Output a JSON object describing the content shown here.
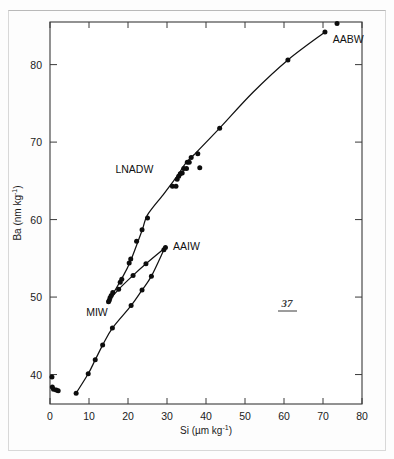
{
  "page": {
    "page_number": "37"
  },
  "chart_data": {
    "type": "scatter",
    "title": "",
    "subtitle": "",
    "xlabel": "Si (µm kg⁻¹)",
    "ylabel": "Ba (nm kg⁻¹)",
    "xlabel_parts": {
      "base": "Si (µm kg",
      "exponent": "-1",
      "tail": ")"
    },
    "ylabel_parts": {
      "base": "Ba (nm kg",
      "exponent": "-1",
      "tail": ")"
    },
    "xlim": [
      0,
      80
    ],
    "ylim": [
      36.2,
      85.5
    ],
    "xticks": [
      0,
      10,
      20,
      30,
      40,
      50,
      60,
      70,
      80
    ],
    "yticks": [
      40,
      50,
      60,
      70,
      80
    ],
    "xtick_labels": [
      "0",
      "10",
      "20",
      "30",
      "40",
      "50",
      "60",
      "70",
      "80"
    ],
    "ytick_labels": [
      "40",
      "50",
      "60",
      "70",
      "80"
    ],
    "grid": false,
    "legend_position": "inline-annotations",
    "marker_color": "#0d0d0d",
    "line_color": "#111111",
    "annotations": [
      {
        "label": "AABW",
        "x": 71.5,
        "y": 84.0,
        "anchor": "start",
        "dx": 4,
        "dy": 9
      },
      {
        "label": "LNADW",
        "x": 27.0,
        "y": 66.4,
        "anchor": "end",
        "dx": -2,
        "dy": 3
      },
      {
        "label": "AAIW",
        "x": 30.8,
        "y": 56.3,
        "anchor": "start",
        "dx": 3,
        "dy": 2
      },
      {
        "label": "MIW",
        "x": 14.3,
        "y": 49.0,
        "anchor": "end",
        "dx": 2,
        "dy": 11
      }
    ],
    "series": [
      {
        "name": "deep-water-main-curve",
        "label": "LNADW-AABW main trend",
        "type": "line",
        "points": [
          {
            "x": 15.3,
            "y": 49.7
          },
          {
            "x": 18.3,
            "y": 52.3
          },
          {
            "x": 20.6,
            "y": 54.6
          },
          {
            "x": 23.6,
            "y": 58.6
          },
          {
            "x": 25.0,
            "y": 60.6
          },
          {
            "x": 29.0,
            "y": 63.2
          },
          {
            "x": 31.7,
            "y": 65.0
          },
          {
            "x": 33.0,
            "y": 65.9
          },
          {
            "x": 34.8,
            "y": 67.3
          },
          {
            "x": 37.0,
            "y": 68.4
          },
          {
            "x": 43.5,
            "y": 71.8
          },
          {
            "x": 52.0,
            "y": 76.4
          },
          {
            "x": 61.0,
            "y": 80.6
          },
          {
            "x": 70.5,
            "y": 84.2
          }
        ]
      },
      {
        "name": "aaiw-branch",
        "label": "AAIW branch",
        "type": "line",
        "points": [
          {
            "x": 15.2,
            "y": 49.6
          },
          {
            "x": 17.6,
            "y": 51.0
          },
          {
            "x": 21.3,
            "y": 52.8
          },
          {
            "x": 24.6,
            "y": 54.3
          },
          {
            "x": 29.6,
            "y": 56.4
          }
        ]
      },
      {
        "name": "miw-branch",
        "label": "MIW branch",
        "type": "line",
        "points": [
          {
            "x": 6.7,
            "y": 37.6
          },
          {
            "x": 9.8,
            "y": 40.1
          },
          {
            "x": 11.6,
            "y": 41.9
          },
          {
            "x": 13.5,
            "y": 43.8
          },
          {
            "x": 16.0,
            "y": 46.0
          },
          {
            "x": 20.8,
            "y": 48.9
          },
          {
            "x": 23.6,
            "y": 50.9
          },
          {
            "x": 26.0,
            "y": 52.7
          },
          {
            "x": 29.2,
            "y": 56.1
          }
        ]
      }
    ],
    "scatter_points": [
      {
        "x": 0.5,
        "y": 39.7
      },
      {
        "x": 0.6,
        "y": 38.4
      },
      {
        "x": 0.9,
        "y": 38.1
      },
      {
        "x": 1.6,
        "y": 38.0
      },
      {
        "x": 2.1,
        "y": 37.9
      },
      {
        "x": 6.7,
        "y": 37.6
      },
      {
        "x": 9.8,
        "y": 40.1
      },
      {
        "x": 11.6,
        "y": 41.9
      },
      {
        "x": 13.5,
        "y": 43.8
      },
      {
        "x": 16.0,
        "y": 46.0
      },
      {
        "x": 20.8,
        "y": 48.9
      },
      {
        "x": 23.6,
        "y": 50.9
      },
      {
        "x": 26.0,
        "y": 52.7
      },
      {
        "x": 29.2,
        "y": 56.1
      },
      {
        "x": 15.0,
        "y": 49.4
      },
      {
        "x": 15.2,
        "y": 49.6
      },
      {
        "x": 15.4,
        "y": 49.9
      },
      {
        "x": 15.7,
        "y": 50.2
      },
      {
        "x": 16.1,
        "y": 50.6
      },
      {
        "x": 17.6,
        "y": 51.0
      },
      {
        "x": 18.0,
        "y": 51.9
      },
      {
        "x": 18.4,
        "y": 52.3
      },
      {
        "x": 20.3,
        "y": 54.4
      },
      {
        "x": 20.7,
        "y": 54.9
      },
      {
        "x": 21.3,
        "y": 52.8
      },
      {
        "x": 22.2,
        "y": 57.2
      },
      {
        "x": 24.6,
        "y": 54.3
      },
      {
        "x": 23.6,
        "y": 58.7
      },
      {
        "x": 25.0,
        "y": 60.2
      },
      {
        "x": 29.6,
        "y": 56.4
      },
      {
        "x": 31.4,
        "y": 64.3
      },
      {
        "x": 32.3,
        "y": 64.3
      },
      {
        "x": 32.6,
        "y": 65.2
      },
      {
        "x": 33.0,
        "y": 65.6
      },
      {
        "x": 33.4,
        "y": 65.9
      },
      {
        "x": 33.9,
        "y": 66.0
      },
      {
        "x": 34.3,
        "y": 66.6
      },
      {
        "x": 35.2,
        "y": 67.4
      },
      {
        "x": 35.7,
        "y": 67.4
      },
      {
        "x": 35.0,
        "y": 66.6
      },
      {
        "x": 36.2,
        "y": 68.0
      },
      {
        "x": 37.9,
        "y": 68.5
      },
      {
        "x": 38.4,
        "y": 66.7
      },
      {
        "x": 43.5,
        "y": 71.8
      },
      {
        "x": 61.0,
        "y": 80.6
      },
      {
        "x": 70.5,
        "y": 84.2
      },
      {
        "x": 73.6,
        "y": 85.3
      }
    ]
  }
}
